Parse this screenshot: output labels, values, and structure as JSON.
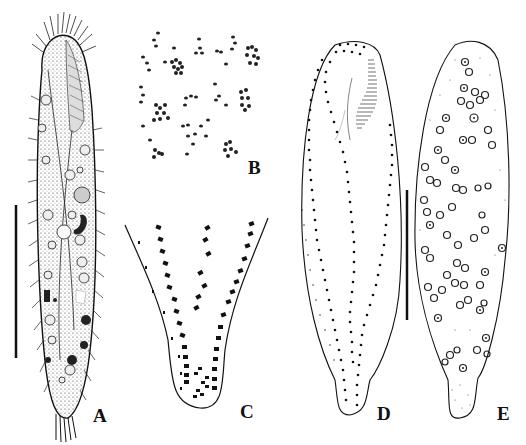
{
  "figure": {
    "panels": [
      {
        "id": "A",
        "label": "A",
        "description": "live ciliate cell, ventral view with cilia, vacuoles and food inclusions",
        "label_pos": [
          93,
          408
        ]
      },
      {
        "id": "B",
        "label": "B",
        "description": "cortical granules / extrusomes clusters",
        "label_pos": [
          248,
          160
        ]
      },
      {
        "id": "C",
        "label": "C",
        "description": "posterior end showing cirral rows",
        "label_pos": [
          240,
          400
        ]
      },
      {
        "id": "D",
        "label": "D",
        "description": "ciliary pattern, ventral side after protargol staining",
        "label_pos": [
          379,
          406
        ]
      },
      {
        "id": "E",
        "label": "E",
        "description": "nuclear apparatus, macronuclear nodules",
        "label_pos": [
          500,
          406
        ]
      }
    ],
    "scale_bars": [
      {
        "panel": "A",
        "x": 16,
        "y1": 205,
        "y2": 358
      },
      {
        "panel": "D-E",
        "x": 407,
        "y1": 190,
        "y2": 320
      }
    ],
    "colors": {
      "ink": "#111111",
      "background": "#ffffff"
    }
  }
}
